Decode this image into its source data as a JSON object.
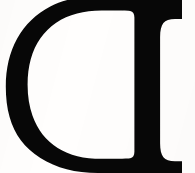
{
  "image": {
    "kind": "glyph-specimen",
    "description": "Horizontally mirrored serif capital letter D",
    "letter": "D",
    "transform": "mirrored-horizontal",
    "typeface_style": "serif",
    "width": 195,
    "height": 173,
    "alt_text": "Large black mirrored serif capital D on white background",
    "cropped_edges": "top, right"
  },
  "colors": {
    "background": "#fffefd",
    "ink": "#070707",
    "ink_soft_edge": "#1a1a1a"
  },
  "geometry": {
    "stem_left_x": 134,
    "stem_right_x": 160,
    "serif_right_x": 182,
    "top_serif_y": 8,
    "bottom_serif_y": 172,
    "bowl_leftmost_x": 12,
    "bowl_thickness_mid": 30,
    "counter_left_x": 42,
    "counter_right_x": 134,
    "counter_top_y": 19,
    "counter_bottom_y": 158,
    "cap_height_px": 164
  },
  "glyph_outline": {
    "outer": "M 182 7 L 182 19 L 175 19 C 169.5 19 165.6 20.4 163.4 23.1 C 161.2 25.9 160.1 30.6 160.1 37.3 L 160.1 143.2 C 160.1 149.8 161.2 154.4 163.4 157.2 C 165.6 159.9 169.5 161.3 175 161.3 L 182 161.3 L 182 173 L 98 173 C 75.5 173 56.3 168.0 40.4 158.0 C 24.6 148.0 14.3 134.3 9.6 117.0 C 7.0 107.6 5.8 97.4 5.8 86.4 C 5.8 68.2 9.6 52.2 17.2 38.4 C 24.9 24.6 35.9 13.9 50.3 6.4 C 61.4 0.6 74.1 -2.4 88.4 -2.8 L 98 -2.9 L 182 -2.9 Z",
    "counter": "M 134.4 20.6 L 134.4 151.8 C 134.4 155.7 133.0 157.8 130.2 158.3 C 128.6 158.6 124.3 158.8 117.4 158.8 L 101.5 158.8 C 84.0 158.8 69.4 155.2 57.7 147.9 C 46.0 140.6 37.6 130.0 32.6 116.0 C 29.3 106.7 27.6 96.3 27.6 84.8 C 27.6 66.0 31.9 50.4 40.6 38.1 C 49.3 25.7 61.4 17.5 77.1 13.4 C 84.5 11.5 92.6 10.5 101.5 10.5 L 117.4 10.5 C 124.3 10.5 128.6 10.7 130.2 11.0 C 133.0 11.5 134.4 13.6 134.4 17.5 Z"
  }
}
